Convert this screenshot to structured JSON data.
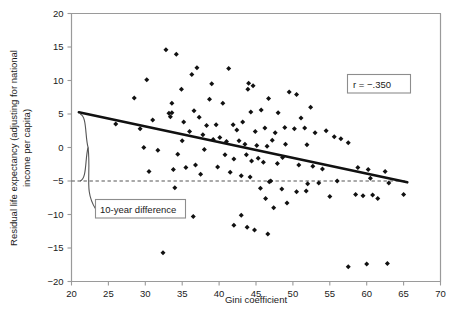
{
  "chart_data": {
    "type": "scatter",
    "title": "",
    "xlabel": "Gini coefficient",
    "ylabel": "Residual life expectancy (adjusting for national income per capita)",
    "xlim": [
      20,
      70
    ],
    "ylim": [
      -20,
      20
    ],
    "xticks": [
      20,
      25,
      30,
      35,
      40,
      45,
      50,
      55,
      60,
      65,
      70
    ],
    "yticks": [
      20,
      15,
      10,
      5,
      0,
      -5,
      -10,
      -15,
      -20
    ],
    "grid": false,
    "legend": null,
    "annotations": [
      {
        "name": "correlation-box",
        "text": "r = −.350",
        "x": 58.5,
        "y": 11.5,
        "boxed": true
      },
      {
        "name": "ten-year-difference-box",
        "text": "10-year difference",
        "x": 27.5,
        "y": -9.6,
        "boxed": true
      }
    ],
    "reference_line": {
      "name": "dashed-reference-line",
      "orientation": "horizontal",
      "y": -5,
      "style": "dashed",
      "x_start": 20,
      "x_end": 65.5
    },
    "brace": {
      "name": "ten-year-brace",
      "y_top": 5,
      "y_bottom": -5,
      "x": 21.3,
      "span_years": 10
    },
    "series": [
      {
        "name": "Countries",
        "marker": "diamond",
        "color": "#111111",
        "points": [
          [
            32.8,
            14.6
          ],
          [
            34.2,
            13.9
          ],
          [
            30.2,
            10.1
          ],
          [
            37.0,
            11.9
          ],
          [
            41.3,
            11.8
          ],
          [
            36.3,
            10.9
          ],
          [
            39.0,
            9.5
          ],
          [
            44.0,
            9.6
          ],
          [
            44.6,
            9.2
          ],
          [
            43.9,
            8.7
          ],
          [
            34.9,
            8.7
          ],
          [
            38.7,
            7.2
          ],
          [
            33.6,
            6.6
          ],
          [
            40.5,
            6.6
          ],
          [
            46.7,
            7.3
          ],
          [
            28.5,
            7.4
          ],
          [
            33.2,
            5.1
          ],
          [
            33.6,
            5.2
          ],
          [
            33.4,
            4.6
          ],
          [
            36.6,
            5.5
          ],
          [
            45.7,
            5.6
          ],
          [
            44.3,
            5.3
          ],
          [
            48.0,
            5.2
          ],
          [
            49.5,
            8.3
          ],
          [
            50.5,
            7.9
          ],
          [
            52.4,
            6.0
          ],
          [
            51.1,
            4.4
          ],
          [
            26.0,
            3.5
          ],
          [
            29.3,
            2.8
          ],
          [
            31.0,
            4.1
          ],
          [
            35.2,
            3.8
          ],
          [
            37.3,
            4.5
          ],
          [
            38.3,
            3.3
          ],
          [
            39.6,
            3.4
          ],
          [
            41.9,
            3.4
          ],
          [
            43.2,
            3.8
          ],
          [
            42.4,
            2.6
          ],
          [
            44.9,
            2.4
          ],
          [
            46.2,
            2.9
          ],
          [
            47.6,
            2.2
          ],
          [
            48.9,
            3.0
          ],
          [
            50.2,
            2.8
          ],
          [
            51.6,
            2.9
          ],
          [
            53.0,
            2.2
          ],
          [
            54.5,
            2.5
          ],
          [
            55.6,
            1.6
          ],
          [
            36.0,
            2.4
          ],
          [
            37.8,
            1.9
          ],
          [
            39.2,
            1.2
          ],
          [
            40.1,
            1.5
          ],
          [
            35.0,
            1.0
          ],
          [
            41.0,
            0.9
          ],
          [
            42.7,
            1.0
          ],
          [
            43.5,
            0.5
          ],
          [
            45.1,
            0.3
          ],
          [
            46.5,
            0.2
          ],
          [
            47.2,
            1.1
          ],
          [
            49.0,
            0.5
          ],
          [
            51.9,
            0.4
          ],
          [
            56.5,
            1.3
          ],
          [
            57.5,
            0.7
          ],
          [
            29.8,
            0.0
          ],
          [
            31.7,
            -0.4
          ],
          [
            34.4,
            -1.0
          ],
          [
            38.0,
            -0.3
          ],
          [
            40.8,
            -1.1
          ],
          [
            42.0,
            -1.7
          ],
          [
            43.7,
            -1.1
          ],
          [
            44.4,
            -2.0
          ],
          [
            45.3,
            -1.6
          ],
          [
            46.0,
            -2.2
          ],
          [
            47.9,
            -2.4
          ],
          [
            48.6,
            -1.5
          ],
          [
            50.8,
            -2.6
          ],
          [
            52.7,
            -2.8
          ],
          [
            54.0,
            -3.2
          ],
          [
            58.8,
            -3.0
          ],
          [
            60.2,
            -3.3
          ],
          [
            62.5,
            -3.6
          ],
          [
            36.8,
            -2.6
          ],
          [
            39.8,
            -2.9
          ],
          [
            41.5,
            -3.7
          ],
          [
            30.5,
            -3.6
          ],
          [
            33.8,
            -3.3
          ],
          [
            35.5,
            -3.0
          ],
          [
            37.5,
            -4.0
          ],
          [
            43.0,
            -4.2
          ],
          [
            44.2,
            -4.4
          ],
          [
            46.8,
            -5.1
          ],
          [
            47.0,
            -5.0
          ],
          [
            52.0,
            -5.4
          ],
          [
            53.5,
            -5.3
          ],
          [
            56.0,
            -5.0
          ],
          [
            60.5,
            -4.6
          ],
          [
            63.0,
            -5.3
          ],
          [
            34.0,
            -6.0
          ],
          [
            48.5,
            -6.2
          ],
          [
            45.6,
            -6.1
          ],
          [
            50.5,
            -6.6
          ],
          [
            51.8,
            -6.5
          ],
          [
            55.0,
            -7.3
          ],
          [
            58.5,
            -7.0
          ],
          [
            59.5,
            -7.2
          ],
          [
            60.8,
            -7.1
          ],
          [
            61.5,
            -7.6
          ],
          [
            65.0,
            -7.0
          ],
          [
            46.3,
            -7.6
          ],
          [
            49.2,
            -8.3
          ],
          [
            47.4,
            -9.0
          ],
          [
            36.5,
            -10.3
          ],
          [
            43.0,
            -10.1
          ],
          [
            42.0,
            -11.6
          ],
          [
            43.8,
            -11.9
          ],
          [
            44.8,
            -12.3
          ],
          [
            46.6,
            -12.9
          ],
          [
            32.4,
            -15.7
          ],
          [
            57.5,
            -17.8
          ],
          [
            60.0,
            -17.4
          ],
          [
            62.8,
            -17.3
          ]
        ]
      }
    ],
    "trendline": {
      "name": "regression-line",
      "x_start": 21.0,
      "y_start": 5.25,
      "x_end": 65.5,
      "y_end": -5.2,
      "r": -0.35
    }
  },
  "axes": {
    "x_title": "Gini coefficient",
    "y_title_line1": "Residual life expectancy (adjusting for national",
    "y_title_line2": "income per capita)",
    "x_tick_labels": [
      "20",
      "25",
      "30",
      "35",
      "40",
      "45",
      "50",
      "55",
      "60",
      "65",
      "70"
    ],
    "y_tick_labels": [
      "20",
      "15",
      "10",
      "5",
      "0",
      "−5",
      "−10",
      "−15",
      "−20"
    ]
  },
  "annotations": {
    "correlation_label": "r = −.350",
    "brace_label": "10-year difference"
  },
  "colors": {
    "marker": "#111111",
    "trendline": "#111111",
    "reference_line": "#555555",
    "axis": "#888888",
    "text": "#1a1a1a",
    "box_border": "#888888",
    "background": "#ffffff"
  }
}
